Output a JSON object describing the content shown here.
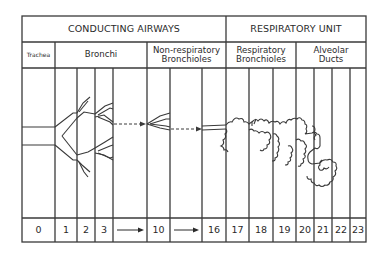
{
  "header": {
    "left": "CONDUCTING AIRWAYS",
    "right": "RESPIRATORY UNIT"
  },
  "zones": {
    "trachea": "Trachea",
    "bronchi": "Bronchi",
    "nonresp_line1": "Non-respiratory",
    "nonresp_line2": "Bronchioles",
    "resp_line1": "Respiratory",
    "resp_line2": "Bronchioles",
    "alv_line1": "Alveolar",
    "alv_line2": "Ducts"
  },
  "generations": [
    "0",
    "1",
    "2",
    "3",
    "→",
    "10",
    "→",
    "16",
    "17",
    "18",
    "19",
    "20",
    "21",
    "22",
    "23"
  ],
  "colors": {
    "line": "#3a3a3a",
    "text": "#2a2a2a",
    "background": "#ffffff"
  }
}
